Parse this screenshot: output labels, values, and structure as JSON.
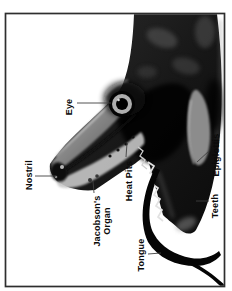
{
  "diagram": {
    "labels": {
      "eye": "Eye",
      "nostril": "Nostril",
      "jacobsons_organ": "Jacobson's Organ",
      "heat_pits": "Heat Pits",
      "epiglottis": "Epiglottis",
      "teeth": "Teeth",
      "tongue": "Tongue"
    },
    "colors": {
      "background": "#ffffff",
      "frame_border": "#2e2e2e",
      "label_text": "#0a0a0a",
      "leader_line": "#3f3f3f",
      "snake_dark": "#161616",
      "snake_mid": "#6f6f6f",
      "snake_light": "#b9b9b9",
      "eye_ring": "#aeaeae",
      "tongue": "#050505"
    }
  }
}
